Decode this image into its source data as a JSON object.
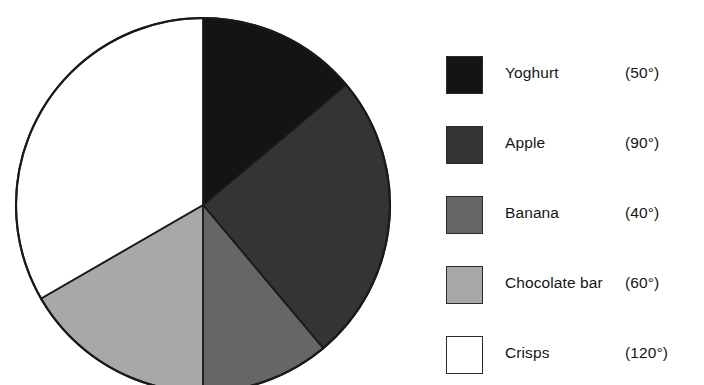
{
  "chart_data": {
    "type": "pie",
    "title": "",
    "subtitle": "",
    "xlabel": "",
    "ylabel": "",
    "units": "degrees",
    "total_degrees": 360,
    "start_angle_deg": 0,
    "direction": "clockwise",
    "grid": false,
    "legend_position": "right",
    "categories": [
      "Yoghurt",
      "Apple",
      "Banana",
      "Chocolate bar",
      "Crisps"
    ],
    "values": [
      50,
      90,
      40,
      60,
      120
    ],
    "value_labels": [
      "(50°)",
      "(90°)",
      "(40°)",
      "(60°)",
      "(120°)"
    ],
    "colors": [
      "#141414",
      "#343434",
      "#666666",
      "#a8a8a8",
      "#ffffff"
    ],
    "slices": [
      {
        "label": "Yoghurt",
        "degrees": 50,
        "value_label": "(50°)",
        "color": "#141414",
        "start_deg": 0,
        "end_deg": 50
      },
      {
        "label": "Apple",
        "degrees": 90,
        "value_label": "(90°)",
        "color": "#343434",
        "start_deg": 50,
        "end_deg": 140
      },
      {
        "label": "Banana",
        "degrees": 40,
        "value_label": "(40°)",
        "color": "#666666",
        "start_deg": 140,
        "end_deg": 180
      },
      {
        "label": "Chocolate bar",
        "degrees": 60,
        "value_label": "(60°)",
        "color": "#a8a8a8",
        "start_deg": 180,
        "end_deg": 240
      },
      {
        "label": "Crisps",
        "degrees": 120,
        "value_label": "(120°)",
        "color": "#ffffff",
        "start_deg": 240,
        "end_deg": 360
      }
    ]
  },
  "pie": {
    "center_x": 203,
    "center_y": 205,
    "radius": 187,
    "outline_color": "#1a1a1a"
  },
  "legend": {
    "items": [
      {
        "label": "Yoghurt",
        "value_label": "(50°)",
        "color": "#141414"
      },
      {
        "label": "Apple",
        "value_label": "(90°)",
        "color": "#343434"
      },
      {
        "label": "Banana",
        "value_label": "(40°)",
        "color": "#666666"
      },
      {
        "label": "Chocolate bar",
        "value_label": "(60°)",
        "color": "#a8a8a8"
      },
      {
        "label": "Crisps",
        "value_label": "(120°)",
        "color": "#ffffff"
      }
    ]
  }
}
